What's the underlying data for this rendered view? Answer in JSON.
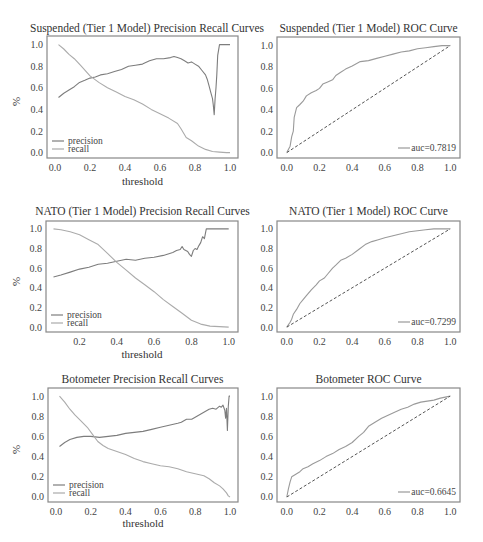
{
  "colors": {
    "precision": "#7d7d7d",
    "recall": "#ababab",
    "roc": "#9a9a9a",
    "diagonal": "#555555",
    "frame": "#888888"
  },
  "chart_data": [
    {
      "id": "pr-suspended",
      "type": "line",
      "title": "Suspended (Tier 1 Model) Precision Recall Curves",
      "xlabel": "threshold",
      "ylabel": "%",
      "xlim": [
        -0.046,
        1.046
      ],
      "ylim": [
        -0.05,
        1.08
      ],
      "xticks": [
        0.0,
        0.2,
        0.4,
        0.6,
        0.8,
        1.0
      ],
      "yticks": [
        0.0,
        0.2,
        0.4,
        0.6,
        0.8,
        1.0
      ],
      "legend": {
        "position": "lower left",
        "entries": [
          "precision",
          "recall"
        ]
      },
      "series": [
        {
          "name": "precision",
          "x": [
            0.02,
            0.05,
            0.08,
            0.11,
            0.14,
            0.17,
            0.2,
            0.23,
            0.26,
            0.3,
            0.34,
            0.38,
            0.42,
            0.46,
            0.5,
            0.54,
            0.58,
            0.62,
            0.66,
            0.68,
            0.7,
            0.72,
            0.74,
            0.76,
            0.78,
            0.8,
            0.82,
            0.84,
            0.86,
            0.87,
            0.88,
            0.89,
            0.9,
            0.905,
            0.91,
            0.915,
            0.92,
            0.925,
            0.93,
            0.94,
            0.97,
            1.0
          ],
          "y": [
            0.51,
            0.55,
            0.58,
            0.61,
            0.65,
            0.67,
            0.69,
            0.7,
            0.72,
            0.73,
            0.75,
            0.77,
            0.8,
            0.81,
            0.82,
            0.85,
            0.87,
            0.87,
            0.88,
            0.89,
            0.88,
            0.87,
            0.85,
            0.83,
            0.84,
            0.82,
            0.8,
            0.76,
            0.72,
            0.68,
            0.62,
            0.56,
            0.5,
            0.44,
            0.35,
            0.5,
            0.6,
            0.72,
            0.9,
            1.0,
            1.0,
            1.0
          ]
        },
        {
          "name": "recall",
          "x": [
            0.02,
            0.05,
            0.08,
            0.11,
            0.15,
            0.2,
            0.25,
            0.3,
            0.35,
            0.4,
            0.45,
            0.5,
            0.55,
            0.6,
            0.65,
            0.7,
            0.72,
            0.75,
            0.78,
            0.82,
            0.86,
            0.9,
            0.94,
            0.98,
            1.0
          ],
          "y": [
            1.0,
            0.96,
            0.91,
            0.87,
            0.8,
            0.71,
            0.65,
            0.6,
            0.56,
            0.52,
            0.49,
            0.45,
            0.4,
            0.36,
            0.32,
            0.27,
            0.22,
            0.14,
            0.11,
            0.06,
            0.03,
            0.01,
            0.005,
            0.0,
            0.0
          ]
        }
      ]
    },
    {
      "id": "roc-suspended",
      "type": "line",
      "title": "Suspended (Tier 1 Model) ROC Curve",
      "xlabel": "",
      "ylabel": "",
      "xlim": [
        -0.06,
        1.06
      ],
      "ylim": [
        -0.05,
        1.08
      ],
      "xticks": [
        0.0,
        0.2,
        0.4,
        0.6,
        0.8,
        1.0
      ],
      "yticks": [
        0.0,
        0.2,
        0.4,
        0.6,
        0.8,
        1.0
      ],
      "legend": {
        "position": "lower right",
        "entries": [
          "auc=0.7819"
        ]
      },
      "auc": 0.7819,
      "series": [
        {
          "name": "auc=0.7819",
          "x": [
            0.0,
            0.02,
            0.03,
            0.04,
            0.045,
            0.05,
            0.06,
            0.08,
            0.1,
            0.12,
            0.15,
            0.18,
            0.2,
            0.22,
            0.25,
            0.28,
            0.3,
            0.33,
            0.36,
            0.4,
            0.45,
            0.5,
            0.55,
            0.6,
            0.65,
            0.7,
            0.75,
            0.8,
            0.85,
            0.9,
            0.95,
            1.0
          ],
          "y": [
            0.0,
            0.06,
            0.15,
            0.2,
            0.33,
            0.36,
            0.42,
            0.45,
            0.48,
            0.53,
            0.56,
            0.58,
            0.6,
            0.64,
            0.66,
            0.68,
            0.72,
            0.75,
            0.78,
            0.81,
            0.85,
            0.86,
            0.88,
            0.9,
            0.92,
            0.94,
            0.95,
            0.97,
            0.98,
            0.99,
            1.0,
            1.0
          ]
        },
        {
          "name": "diagonal",
          "x": [
            0.0,
            1.0
          ],
          "y": [
            0.0,
            1.0
          ],
          "dashed": true
        }
      ]
    },
    {
      "id": "pr-nato",
      "type": "line",
      "title": "NATO (Tier 1 Model) Precision Recall Curves",
      "xlabel": "threshold",
      "ylabel": "%",
      "xlim": [
        0.02,
        1.05
      ],
      "ylim": [
        -0.05,
        1.08
      ],
      "xticks": [
        0.2,
        0.4,
        0.6,
        0.8,
        1.0
      ],
      "yticks": [
        0.0,
        0.2,
        0.4,
        0.6,
        0.8,
        1.0
      ],
      "legend": {
        "position": "lower left",
        "entries": [
          "precision",
          "recall"
        ]
      },
      "series": [
        {
          "name": "precision",
          "x": [
            0.06,
            0.1,
            0.15,
            0.2,
            0.25,
            0.3,
            0.35,
            0.4,
            0.45,
            0.5,
            0.55,
            0.6,
            0.65,
            0.7,
            0.72,
            0.74,
            0.75,
            0.76,
            0.78,
            0.79,
            0.8,
            0.81,
            0.82,
            0.83,
            0.84,
            0.85,
            0.86,
            0.87,
            0.88,
            0.9,
            0.95,
            1.0
          ],
          "y": [
            0.51,
            0.53,
            0.56,
            0.59,
            0.61,
            0.64,
            0.65,
            0.67,
            0.69,
            0.68,
            0.7,
            0.71,
            0.73,
            0.76,
            0.78,
            0.79,
            0.82,
            0.79,
            0.77,
            0.74,
            0.72,
            0.78,
            0.8,
            0.79,
            0.83,
            0.86,
            0.92,
            0.9,
            1.0,
            1.0,
            1.0,
            1.0
          ]
        },
        {
          "name": "recall",
          "x": [
            0.06,
            0.1,
            0.15,
            0.2,
            0.25,
            0.3,
            0.35,
            0.4,
            0.45,
            0.5,
            0.55,
            0.6,
            0.65,
            0.7,
            0.75,
            0.8,
            0.85,
            0.9,
            0.95,
            1.0
          ],
          "y": [
            1.0,
            0.99,
            0.97,
            0.94,
            0.89,
            0.84,
            0.75,
            0.66,
            0.58,
            0.5,
            0.43,
            0.36,
            0.28,
            0.21,
            0.14,
            0.07,
            0.03,
            0.01,
            0.005,
            0.0
          ]
        }
      ]
    },
    {
      "id": "roc-nato",
      "type": "line",
      "title": "NATO (Tier 1 Model) ROC Curve",
      "xlabel": "",
      "ylabel": "",
      "xlim": [
        -0.06,
        1.06
      ],
      "ylim": [
        -0.05,
        1.08
      ],
      "xticks": [
        0.0,
        0.2,
        0.4,
        0.6,
        0.8,
        1.0
      ],
      "yticks": [
        0.0,
        0.2,
        0.4,
        0.6,
        0.8,
        1.0
      ],
      "legend": {
        "position": "lower right",
        "entries": [
          "auc=0.7299"
        ]
      },
      "auc": 0.7299,
      "series": [
        {
          "name": "auc=0.7299",
          "x": [
            0.0,
            0.02,
            0.03,
            0.04,
            0.06,
            0.08,
            0.1,
            0.12,
            0.15,
            0.18,
            0.2,
            0.23,
            0.25,
            0.28,
            0.3,
            0.33,
            0.36,
            0.4,
            0.44,
            0.48,
            0.52,
            0.56,
            0.6,
            0.65,
            0.7,
            0.75,
            0.8,
            0.85,
            0.9,
            0.95,
            1.0
          ],
          "y": [
            0.0,
            0.05,
            0.08,
            0.13,
            0.18,
            0.24,
            0.28,
            0.32,
            0.38,
            0.43,
            0.47,
            0.5,
            0.54,
            0.6,
            0.63,
            0.68,
            0.7,
            0.74,
            0.79,
            0.84,
            0.87,
            0.89,
            0.91,
            0.93,
            0.95,
            0.97,
            0.98,
            0.99,
            1.0,
            1.0,
            1.0
          ]
        },
        {
          "name": "diagonal",
          "x": [
            0.0,
            1.0
          ],
          "y": [
            0.0,
            1.0
          ],
          "dashed": true
        }
      ]
    },
    {
      "id": "pr-botometer",
      "type": "line",
      "title": "Botometer Precision Recall Curves",
      "xlabel": "threshold",
      "ylabel": "%",
      "xlim": [
        -0.046,
        1.046
      ],
      "ylim": [
        -0.05,
        1.08
      ],
      "xticks": [
        0.0,
        0.2,
        0.4,
        0.6,
        0.8,
        1.0
      ],
      "yticks": [
        0.0,
        0.2,
        0.4,
        0.6,
        0.8,
        1.0
      ],
      "legend": {
        "position": "lower left",
        "entries": [
          "precision",
          "recall"
        ]
      },
      "series": [
        {
          "name": "precision",
          "x": [
            0.02,
            0.05,
            0.08,
            0.12,
            0.16,
            0.2,
            0.25,
            0.3,
            0.35,
            0.4,
            0.45,
            0.5,
            0.55,
            0.6,
            0.65,
            0.7,
            0.72,
            0.75,
            0.78,
            0.8,
            0.83,
            0.86,
            0.88,
            0.9,
            0.92,
            0.94,
            0.95,
            0.96,
            0.97,
            0.975,
            0.98,
            0.985,
            0.99,
            0.995,
            1.0
          ],
          "y": [
            0.5,
            0.54,
            0.57,
            0.59,
            0.6,
            0.6,
            0.59,
            0.6,
            0.61,
            0.63,
            0.64,
            0.65,
            0.67,
            0.69,
            0.71,
            0.73,
            0.74,
            0.77,
            0.77,
            0.79,
            0.82,
            0.85,
            0.87,
            0.88,
            0.87,
            0.9,
            0.89,
            0.91,
            0.86,
            0.78,
            0.88,
            0.66,
            0.9,
            1.0,
            1.0
          ]
        },
        {
          "name": "recall",
          "x": [
            0.02,
            0.05,
            0.08,
            0.11,
            0.14,
            0.18,
            0.21,
            0.24,
            0.27,
            0.3,
            0.35,
            0.4,
            0.45,
            0.5,
            0.55,
            0.6,
            0.65,
            0.7,
            0.75,
            0.8,
            0.85,
            0.88,
            0.91,
            0.94,
            0.96,
            0.98,
            0.99,
            1.0
          ],
          "y": [
            1.0,
            0.94,
            0.87,
            0.81,
            0.76,
            0.69,
            0.62,
            0.55,
            0.51,
            0.48,
            0.45,
            0.42,
            0.38,
            0.35,
            0.33,
            0.31,
            0.3,
            0.28,
            0.25,
            0.23,
            0.21,
            0.18,
            0.14,
            0.11,
            0.08,
            0.04,
            0.01,
            0.0
          ]
        }
      ]
    },
    {
      "id": "roc-botometer",
      "type": "line",
      "title": "Botometer ROC Curve",
      "xlabel": "",
      "ylabel": "",
      "xlim": [
        -0.06,
        1.06
      ],
      "ylim": [
        -0.05,
        1.08
      ],
      "xticks": [
        0.0,
        0.2,
        0.4,
        0.6,
        0.8,
        1.0
      ],
      "yticks": [
        0.0,
        0.2,
        0.4,
        0.6,
        0.8,
        1.0
      ],
      "legend": {
        "position": "lower right",
        "entries": [
          "auc=0.6645"
        ]
      },
      "auc": 0.6645,
      "series": [
        {
          "name": "auc=0.6645",
          "x": [
            0.0,
            0.01,
            0.02,
            0.03,
            0.05,
            0.08,
            0.1,
            0.13,
            0.16,
            0.2,
            0.24,
            0.28,
            0.32,
            0.36,
            0.4,
            0.44,
            0.47,
            0.5,
            0.54,
            0.58,
            0.62,
            0.66,
            0.7,
            0.74,
            0.78,
            0.82,
            0.86,
            0.9,
            0.94,
            0.97,
            1.0
          ],
          "y": [
            0.0,
            0.08,
            0.15,
            0.2,
            0.22,
            0.25,
            0.28,
            0.3,
            0.33,
            0.36,
            0.4,
            0.43,
            0.47,
            0.5,
            0.54,
            0.6,
            0.64,
            0.7,
            0.74,
            0.78,
            0.81,
            0.84,
            0.87,
            0.89,
            0.92,
            0.94,
            0.95,
            0.96,
            0.98,
            0.99,
            1.0
          ]
        },
        {
          "name": "diagonal",
          "x": [
            0.0,
            1.0
          ],
          "y": [
            0.0,
            1.0
          ],
          "dashed": true
        }
      ]
    }
  ],
  "panels": [
    {
      "title": "Suspended (Tier 1 Model) Precision Recall Curves",
      "xlabel": "threshold",
      "ylabel": "%"
    },
    {
      "title": "Suspended (Tier 1 Model) ROC Curve"
    },
    {
      "title": "NATO (Tier 1 Model) Precision Recall Curves",
      "xlabel": "threshold",
      "ylabel": "%"
    },
    {
      "title": "NATO (Tier 1 Model) ROC Curve"
    },
    {
      "title": "Botometer Precision Recall Curves",
      "xlabel": "threshold",
      "ylabel": "%"
    },
    {
      "title": "Botometer ROC Curve"
    }
  ]
}
